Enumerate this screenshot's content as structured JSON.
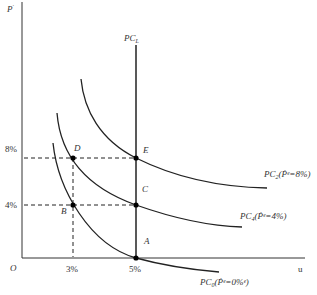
{
  "diagram": {
    "y_axis_label": "P",
    "y_axis_label_superscript": "·",
    "x_axis_label": "u",
    "origin_label": "O",
    "y_ticks": [
      "8%",
      "4%"
    ],
    "x_ticks": [
      "3%",
      "5%"
    ],
    "vertical_line_label": "PC",
    "vertical_line_subscript": "L",
    "points": [
      {
        "label": "A"
      },
      {
        "label": "B"
      },
      {
        "label": "C"
      },
      {
        "label": "D"
      },
      {
        "label": "E"
      }
    ],
    "curves": [
      {
        "name": "PC",
        "subscript": "0",
        "annotation": "(Ṗᵉ=0%ᵉ)"
      },
      {
        "name": "PC",
        "subscript": "4",
        "annotation": "(Ṗᵉ=4%)"
      },
      {
        "name": "PC",
        "subscript": "2",
        "annotation": "(Ṗᵉ=8%)"
      }
    ]
  }
}
